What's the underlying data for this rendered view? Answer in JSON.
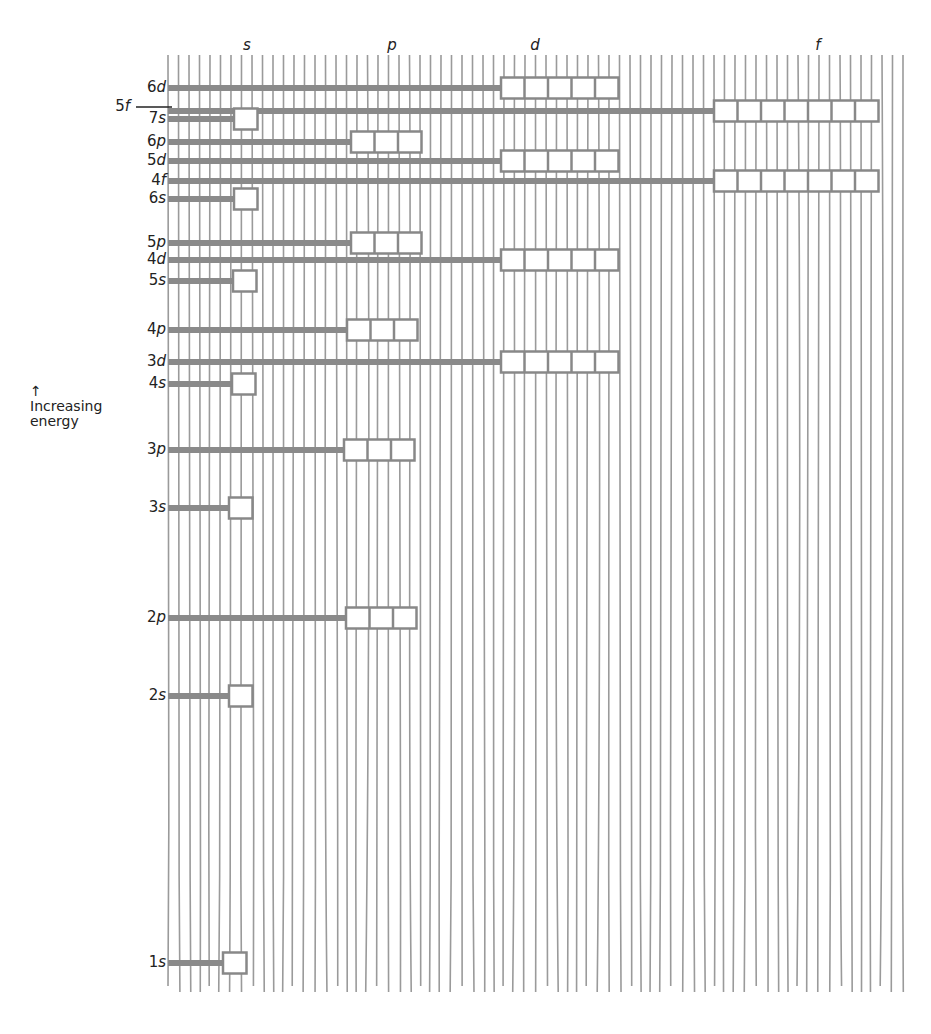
{
  "diagram": {
    "axis_label": {
      "arrow": "↑",
      "line1": "Increasing",
      "line2": "energy"
    },
    "columns": [
      {
        "key": "s",
        "label": "s",
        "x": 247,
        "box_start": 234,
        "box_count": 1
      },
      {
        "key": "p",
        "label": "p",
        "x": 392,
        "box_start": 350,
        "box_count": 3
      },
      {
        "key": "d",
        "label": "d",
        "x": 535,
        "box_start": 501,
        "box_count": 5
      },
      {
        "key": "f",
        "label": "f",
        "x": 818,
        "box_start": 714,
        "box_count": 7
      }
    ],
    "colors": {
      "bar": "#8a8a8a",
      "grid": "#9a9a9a",
      "box_border": "#888888",
      "box_fill": "#ffffff",
      "text": "#222222"
    },
    "levels": [
      {
        "n": "6",
        "l": "d",
        "y": 88,
        "box_x": 501,
        "boxes": 5
      },
      {
        "n": "5",
        "l": "f",
        "y": 111,
        "box_x": 714,
        "boxes": 7,
        "label_offset": "outside"
      },
      {
        "n": "7",
        "l": "s",
        "y": 119,
        "box_x": 234,
        "boxes": 1
      },
      {
        "n": "6",
        "l": "p",
        "y": 142,
        "box_x": 351,
        "boxes": 3
      },
      {
        "n": "5",
        "l": "d",
        "y": 161,
        "box_x": 501,
        "boxes": 5
      },
      {
        "n": "4",
        "l": "f",
        "y": 181,
        "box_x": 714,
        "boxes": 7
      },
      {
        "n": "6",
        "l": "s",
        "y": 199,
        "box_x": 234,
        "boxes": 1
      },
      {
        "n": "5",
        "l": "p",
        "y": 243,
        "box_x": 351,
        "boxes": 3
      },
      {
        "n": "4",
        "l": "d",
        "y": 260,
        "box_x": 501,
        "boxes": 5
      },
      {
        "n": "5",
        "l": "s",
        "y": 281,
        "box_x": 233,
        "boxes": 1
      },
      {
        "n": "4",
        "l": "p",
        "y": 330,
        "box_x": 347,
        "boxes": 3
      },
      {
        "n": "3",
        "l": "d",
        "y": 362,
        "box_x": 501,
        "boxes": 5
      },
      {
        "n": "4",
        "l": "s",
        "y": 384,
        "box_x": 232,
        "boxes": 1
      },
      {
        "n": "3",
        "l": "p",
        "y": 450,
        "box_x": 344,
        "boxes": 3
      },
      {
        "n": "3",
        "l": "s",
        "y": 508,
        "box_x": 229,
        "boxes": 1
      },
      {
        "n": "2",
        "l": "p",
        "y": 618,
        "box_x": 346,
        "boxes": 3
      },
      {
        "n": "2",
        "l": "s",
        "y": 696,
        "box_x": 229,
        "boxes": 1
      },
      {
        "n": "1",
        "l": "s",
        "y": 963,
        "box_x": 223,
        "boxes": 1
      }
    ],
    "grid": {
      "x_start": 168,
      "x_end": 905,
      "y_start": 55,
      "y_end": 992,
      "spacing": 10.5
    }
  }
}
